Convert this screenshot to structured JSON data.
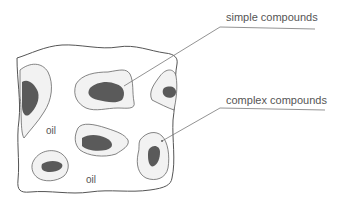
{
  "diagram": {
    "labels": {
      "simple_compounds": "simple compounds",
      "complex_compounds": "complex compounds",
      "oil_1": "oil",
      "oil_2": "oil"
    },
    "colors": {
      "outline": "#555555",
      "halo_fill": "#f2f2f2",
      "core_fill": "#5a5a5a",
      "background": "#ffffff"
    }
  }
}
